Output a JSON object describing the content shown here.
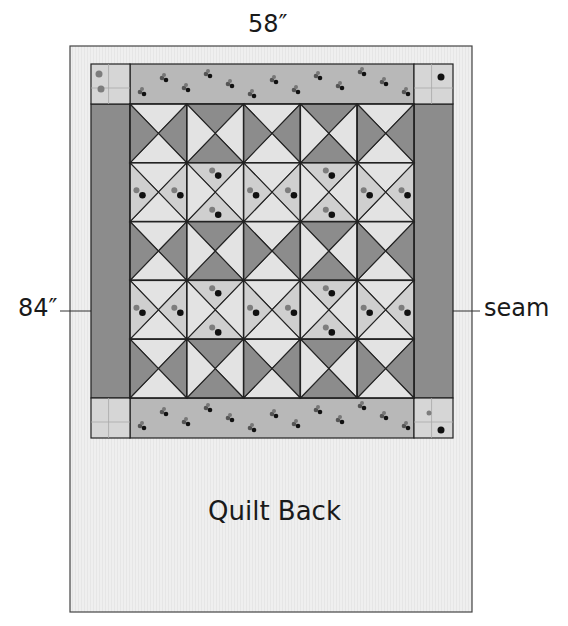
{
  "labels": {
    "width": "58″",
    "height": "84″",
    "seam": "seam",
    "back_title": "Quilt Back"
  },
  "colors": {
    "background": "#ffffff",
    "quilt_back": "#efefef",
    "outline": "#222222",
    "dark_fabric": "#8c8c8c",
    "light_fabric": "#e3e3e3",
    "print_fabric": "#cfcfcf",
    "border_print": "#b8b8b8",
    "corner_square": "#d6d6d6",
    "dot_dark": "#111111",
    "dot_mid": "#7d7d7d"
  },
  "geometry": {
    "back": {
      "x": 70,
      "y": 46,
      "w": 402,
      "h": 566
    },
    "quilt": {
      "x": 91,
      "y": 64,
      "w": 362,
      "h": 374
    },
    "border": {
      "top": 104,
      "bottom": 398,
      "left": 130,
      "right": 414
    },
    "seam_y": 311,
    "seam_left": [
      60,
      70
    ],
    "seam_right": [
      472,
      480
    ]
  },
  "blocks": {
    "cols": 5,
    "rows": 5,
    "pattern_note": "Quarter-square triangle blocks; each block lists fills for [top, right, bottom, left] triangles. D=dark, L=light, P=print",
    "grid": [
      [
        [
          "L",
          "D",
          "L",
          "D"
        ],
        [
          "D",
          "L",
          "D",
          "L"
        ],
        [
          "L",
          "D",
          "L",
          "D"
        ],
        [
          "D",
          "L",
          "D",
          "L"
        ],
        [
          "L",
          "D",
          "L",
          "D"
        ]
      ],
      [
        [
          "L",
          "P",
          "L",
          "P"
        ],
        [
          "P",
          "L",
          "P",
          "L"
        ],
        [
          "L",
          "P",
          "L",
          "P"
        ],
        [
          "P",
          "L",
          "P",
          "L"
        ],
        [
          "L",
          "P",
          "L",
          "P"
        ]
      ],
      [
        [
          "L",
          "D",
          "L",
          "D"
        ],
        [
          "D",
          "L",
          "D",
          "L"
        ],
        [
          "L",
          "D",
          "L",
          "D"
        ],
        [
          "D",
          "L",
          "D",
          "L"
        ],
        [
          "L",
          "D",
          "L",
          "D"
        ]
      ],
      [
        [
          "L",
          "P",
          "L",
          "P"
        ],
        [
          "P",
          "L",
          "P",
          "L"
        ],
        [
          "L",
          "P",
          "L",
          "P"
        ],
        [
          "P",
          "L",
          "P",
          "L"
        ],
        [
          "L",
          "P",
          "L",
          "P"
        ]
      ],
      [
        [
          "L",
          "D",
          "L",
          "D"
        ],
        [
          "D",
          "L",
          "D",
          "L"
        ],
        [
          "L",
          "D",
          "L",
          "D"
        ],
        [
          "D",
          "L",
          "D",
          "L"
        ],
        [
          "L",
          "D",
          "L",
          "D"
        ]
      ]
    ]
  }
}
